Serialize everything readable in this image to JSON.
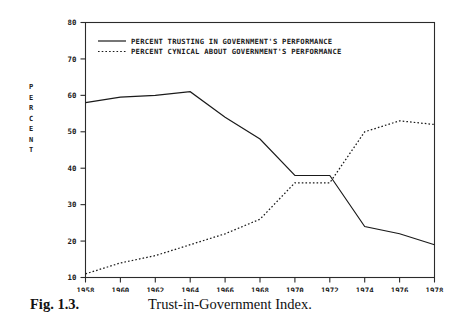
{
  "caption": {
    "figure_number": "Fig. 1.3.",
    "title": "Trust-in-Government Index."
  },
  "axis": {
    "y_title_letters": [
      "P",
      "E",
      "R",
      "C",
      "E",
      "N",
      "T"
    ],
    "y_title": "PERCENT"
  },
  "chart_data": {
    "type": "line",
    "title": "Trust-in-Government Index.",
    "xlabel": "",
    "ylabel": "PERCENT",
    "x": [
      1958,
      1960,
      1962,
      1964,
      1966,
      1968,
      1970,
      1972,
      1974,
      1976,
      1978
    ],
    "xtick_labels": [
      "1958",
      "1960",
      "1962",
      "1964",
      "1966",
      "1968",
      "1970",
      "1972",
      "1974",
      "1976",
      "1978"
    ],
    "xlim": [
      1958,
      1978
    ],
    "ylim": [
      10,
      80
    ],
    "ytick_labels": [
      "10",
      "20",
      "30",
      "40",
      "50",
      "60",
      "70",
      "80"
    ],
    "yticks": [
      10,
      20,
      30,
      40,
      50,
      60,
      70,
      80
    ],
    "grid": false,
    "legend_position": "top-left inside axes",
    "series": [
      {
        "name": "PERCENT TRUSTING IN GOVERNMENT'S PERFORMANCE",
        "style": "solid",
        "color": "#1a1a1a",
        "values": [
          58,
          59.5,
          60,
          61,
          54,
          48,
          38,
          38,
          24,
          22,
          19
        ]
      },
      {
        "name": "PERCENT CYNICAL ABOUT GOVERNMENT'S PERFORMANCE",
        "style": "dotted",
        "color": "#1a1a1a",
        "values": [
          11,
          14,
          16,
          19,
          22,
          26,
          36,
          36,
          50,
          53,
          52
        ]
      }
    ]
  },
  "legend": {
    "entries": [
      {
        "label": "PERCENT TRUSTING IN GOVERNMENT'S PERFORMANCE",
        "style": "solid"
      },
      {
        "label": "PERCENT CYNICAL ABOUT GOVERNMENT'S PERFORMANCE",
        "style": "dotted"
      }
    ]
  }
}
